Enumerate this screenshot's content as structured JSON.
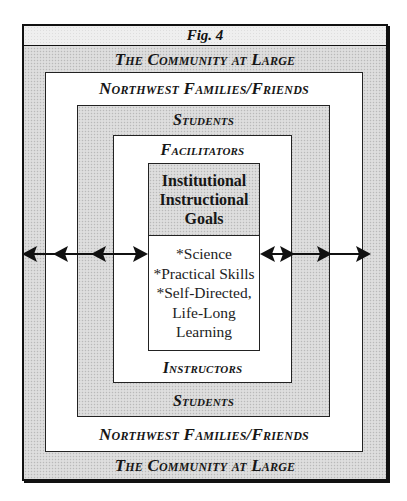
{
  "figure": {
    "title": "Fig. 4",
    "layers": [
      {
        "id": "community",
        "top_label": "The Community at Large",
        "bottom_label": "The Community at Large",
        "fill": "dotted-gray"
      },
      {
        "id": "families",
        "top_label": "Northwest Families/Friends",
        "bottom_label": "Northwest Families/Friends",
        "fill": "white"
      },
      {
        "id": "students",
        "top_label": "Students",
        "bottom_label": "Students",
        "fill": "dotted-gray"
      },
      {
        "id": "facilitators",
        "top_label": "Facilitators",
        "bottom_label": "Instructors",
        "fill": "white"
      }
    ],
    "core": {
      "title_lines": [
        "Institutional",
        "Instructional",
        "Goals"
      ],
      "items": [
        "*Science",
        "*Practical Skills",
        "*Self-Directed,",
        "Life-Long",
        "Learning"
      ]
    },
    "arrows": {
      "left": {
        "description": "bidirectional arrows connecting layers on left side",
        "heads": [
          "left",
          "left",
          "left",
          "right"
        ]
      },
      "right": {
        "description": "bidirectional arrows connecting layers on right side",
        "heads": [
          "left",
          "right",
          "right",
          "right"
        ]
      }
    },
    "colors": {
      "border": "#222222",
      "shade": "#d8d8d8",
      "background": "#ffffff"
    }
  }
}
